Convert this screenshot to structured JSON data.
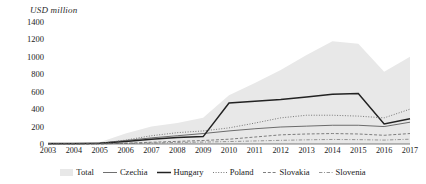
{
  "chart_data": {
    "type": "area",
    "title": "",
    "xlabel": "",
    "ylabel": "USD million",
    "ylim": [
      0,
      1400
    ],
    "yticks": [
      0,
      200,
      400,
      600,
      800,
      1000,
      1200,
      1400
    ],
    "grid": false,
    "legend_position": "bottom",
    "categories": [
      "2003",
      "2004",
      "2005",
      "2006",
      "2007",
      "2008",
      "2009",
      "2010",
      "2011",
      "2012",
      "2013",
      "2014",
      "2015",
      "2016",
      "2017"
    ],
    "series": [
      {
        "name": "Total",
        "style": "area",
        "color": "#e8e8e8",
        "values": [
          10,
          12,
          20,
          120,
          200,
          240,
          300,
          560,
          700,
          850,
          1020,
          1180,
          1150,
          830,
          1000
        ]
      },
      {
        "name": "Czechia",
        "style": "solid-thin",
        "color": "#555555",
        "values": [
          5,
          6,
          10,
          40,
          70,
          95,
          120,
          150,
          175,
          195,
          205,
          215,
          215,
          200,
          250
        ]
      },
      {
        "name": "Hungary",
        "style": "solid-thick",
        "color": "#222222",
        "values": [
          5,
          5,
          8,
          30,
          55,
          75,
          85,
          470,
          490,
          510,
          540,
          570,
          580,
          230,
          290
        ]
      },
      {
        "name": "Poland",
        "style": "dotted",
        "color": "#6a6a6a",
        "values": [
          2,
          3,
          6,
          45,
          95,
          130,
          150,
          185,
          240,
          300,
          330,
          330,
          320,
          300,
          400
        ]
      },
      {
        "name": "Slovakia",
        "style": "dashed",
        "color": "#707070",
        "values": [
          1,
          1,
          2,
          10,
          20,
          30,
          40,
          55,
          80,
          105,
          115,
          120,
          115,
          100,
          120
        ]
      },
      {
        "name": "Slovenia",
        "style": "dash-dot",
        "color": "#8a8a8a",
        "values": [
          1,
          1,
          2,
          8,
          12,
          18,
          22,
          28,
          35,
          42,
          48,
          52,
          50,
          45,
          55
        ]
      }
    ]
  }
}
